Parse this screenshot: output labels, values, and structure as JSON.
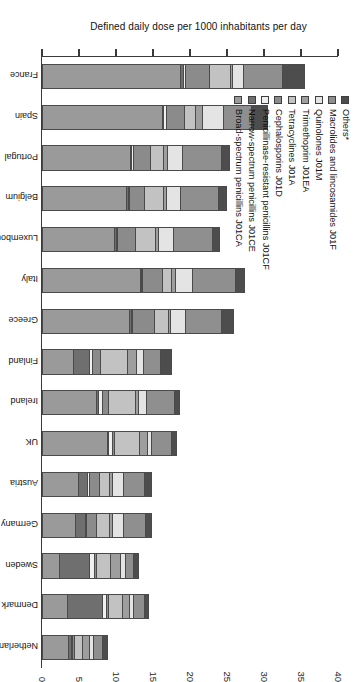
{
  "chart_data": {
    "type": "bar",
    "variant": "stacked-bar",
    "orientation": "vertical-bars-rotated-90",
    "title": "",
    "xlabel": "",
    "ylabel": "Defined daily dose per 1000 inhabitants per day",
    "ylim": [
      0,
      40
    ],
    "ytick_step": 5,
    "ytick_labels": [
      "0",
      "5",
      "10",
      "15",
      "20",
      "25",
      "30",
      "35",
      "40"
    ],
    "grid": false,
    "legend_position": "top-left",
    "categories": [
      "France",
      "Spain",
      "Portugal",
      "Belgium",
      "Luxembourg",
      "Italy",
      "Greece",
      "Finland",
      "Ireland",
      "UK",
      "Austria",
      "Germany",
      "Sweden",
      "Denmark",
      "Netherlands"
    ],
    "series": [
      {
        "name": "Broad-spectrum penicillins J01CA",
        "color": "#9a9a9a",
        "values": [
          18.8,
          16.3,
          12.0,
          11.5,
          9.8,
          13.3,
          11.9,
          4.2,
          7.4,
          8.9,
          5.0,
          4.6,
          2.4,
          3.4,
          3.6
        ]
      },
      {
        "name": "Narrow-spectrum penicillins J01CE",
        "color": "#6f6f6f",
        "values": [
          0.4,
          0.2,
          0.2,
          0.2,
          0.3,
          0.2,
          0.2,
          2.2,
          0.3,
          0.2,
          1.2,
          1.3,
          4.1,
          4.9,
          0.4
        ]
      },
      {
        "name": "Penicillinase-resistant penicillins J01CF",
        "color": "#f0f0f0",
        "values": [
          0.3,
          0.4,
          0.2,
          0.2,
          0.2,
          0.2,
          0.2,
          0.4,
          0.5,
          0.5,
          0.2,
          0.2,
          0.7,
          0.5,
          0.2
        ]
      },
      {
        "name": "Cephalosporins J01D",
        "color": "#8b8b8b",
        "values": [
          3.2,
          2.4,
          2.3,
          2.0,
          2.4,
          2.7,
          3.0,
          1.2,
          0.9,
          0.3,
          1.4,
          1.3,
          0.3,
          0.3,
          0.2
        ]
      },
      {
        "name": "Tetracyclines J01A",
        "color": "#c2c2c2",
        "values": [
          2.9,
          1.6,
          1.8,
          2.6,
          2.7,
          1.2,
          1.9,
          3.6,
          3.6,
          3.4,
          1.4,
          1.8,
          1.9,
          1.9,
          1.2
        ]
      },
      {
        "name": "Trimethoprim J01EA",
        "color": "#9e9e9e",
        "values": [
          0.3,
          0.9,
          0.6,
          0.4,
          0.5,
          0.5,
          0.3,
          1.3,
          0.4,
          1.1,
          0.5,
          0.5,
          1.4,
          1.0,
          0.9
        ]
      },
      {
        "name": "Quinolones J01M",
        "color": "#e4e4e4",
        "values": [
          1.5,
          2.9,
          2.0,
          1.9,
          2.0,
          2.4,
          2.0,
          0.9,
          1.2,
          0.5,
          1.5,
          1.4,
          0.6,
          0.5,
          0.6
        ]
      },
      {
        "name": "Macrolides and lincosamides J01F",
        "color": "#8f8f8f",
        "values": [
          5.3,
          3.8,
          5.3,
          5.3,
          5.3,
          5.8,
          5.0,
          2.4,
          3.8,
          2.8,
          2.9,
          3.1,
          1.2,
          1.5,
          1.3
        ]
      },
      {
        "name": "Others*",
        "color": "#4d4d4d",
        "values": [
          2.8,
          2.0,
          1.0,
          0.9,
          0.8,
          1.1,
          1.4,
          1.4,
          0.6,
          0.5,
          0.7,
          0.7,
          0.5,
          0.4,
          0.5
        ]
      }
    ],
    "totals": [
      35.5,
      30.5,
      25.4,
      25.0,
      24.0,
      27.4,
      25.9,
      17.6,
      18.7,
      18.2,
      14.8,
      14.9,
      13.1,
      14.4,
      8.9
    ],
    "footnote": "*"
  },
  "legend": {
    "items": [
      {
        "label": "Others*",
        "color": "#4d4d4d"
      },
      {
        "label": "Macrolides and lincosamides J01F",
        "color": "#8f8f8f"
      },
      {
        "label": "Quinolones J01M",
        "color": "#e4e4e4"
      },
      {
        "label": "Trimethoprim J01EA",
        "color": "#9e9e9e"
      },
      {
        "label": "Tetracyclines J01A",
        "color": "#c2c2c2"
      },
      {
        "label": "Cephalosporins J01D",
        "color": "#8b8b8b"
      },
      {
        "label": "Penicillinase-resistant  penicillins J01CF",
        "color": "#f0f0f0"
      },
      {
        "label": "Narrow-spectrum penicillins J01CE",
        "color": "#6f6f6f"
      },
      {
        "label": "Broad-spectrum penicillins J01CA",
        "color": "#9a9a9a"
      }
    ]
  },
  "axis": {
    "value_title": "Defined daily dose per 1000 inhabitants per day"
  }
}
